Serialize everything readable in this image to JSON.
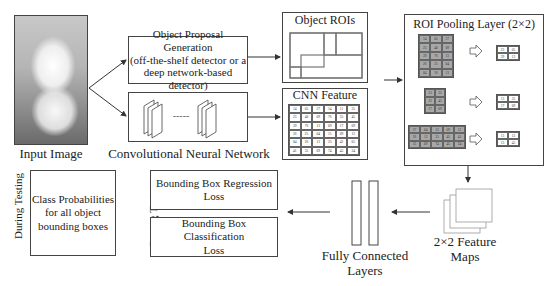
{
  "input": {
    "label": "Input Image",
    "image": "white-kitten-photo"
  },
  "proposal": {
    "lines": [
      "Object Proposal Generation",
      "(off-the-shelf detector or a",
      "deep network-based detector)"
    ]
  },
  "cnn": {
    "label": "Convolutional Neural Network",
    "separator": "-----"
  },
  "object_rois": {
    "title": "Object ROIs"
  },
  "feature_map": {
    "title": "CNN Feature map",
    "rows": [
      [
        "14",
        "05",
        "27",
        "14",
        "11",
        "35"
      ],
      [
        "23",
        "40",
        "09",
        "76",
        "35",
        "45"
      ],
      [
        "39",
        "76",
        "13",
        "09",
        "17",
        "09"
      ],
      [
        "26",
        "25",
        "04",
        "15",
        "09",
        "12"
      ],
      [
        "04",
        "26",
        "13",
        "23",
        "42",
        "05"
      ],
      [
        "41",
        "35",
        "09",
        "74",
        "45",
        "24"
      ]
    ]
  },
  "roi_pooling": {
    "title": "ROI Pooling Layer (2×2)",
    "examples": [
      {
        "input": [
          [
            "14",
            "05",
            "27"
          ],
          [
            "23",
            "40",
            "09"
          ],
          [
            "39",
            "76",
            "13"
          ],
          [
            "26",
            "25",
            "04"
          ],
          [
            "04",
            "26",
            "13"
          ]
        ],
        "output": [
          [
            "23",
            "05"
          ],
          [
            "39",
            "13"
          ]
        ]
      },
      {
        "input": [
          [
            "13",
            "35"
          ],
          [
            "32",
            "45"
          ],
          [
            "17",
            "09"
          ]
        ],
        "output": [
          [
            "13",
            "35"
          ],
          [
            "17",
            "09"
          ]
        ]
      },
      {
        "input": [
          [
            "27",
            "04",
            "13",
            "09",
            "12"
          ],
          [
            "26",
            "13",
            "35",
            "45",
            "45"
          ],
          [
            "35",
            "09",
            "74",
            "45",
            "24"
          ]
        ],
        "output": [
          [
            "13",
            "12"
          ],
          [
            "13",
            "45"
          ]
        ]
      }
    ]
  },
  "feature_maps_2x2": {
    "lines": [
      "2×2 Feature",
      "Maps"
    ]
  },
  "fc_layers": {
    "lines": [
      "Fully Connected",
      "Layers"
    ]
  },
  "training": {
    "side_label": "During Training",
    "boxes": [
      {
        "lines": [
          "Bounding Box Regression",
          "Loss"
        ]
      },
      {
        "lines": [
          "Bounding Box Classification",
          "Loss"
        ]
      }
    ]
  },
  "testing": {
    "side_label": "During Testing",
    "box": {
      "lines": [
        "Class Probabilities",
        "for all object",
        "bounding boxes"
      ]
    }
  },
  "colors": {
    "stroke": "#444444",
    "gray_cell": "#a8a8a8",
    "background": "#ffffff"
  }
}
